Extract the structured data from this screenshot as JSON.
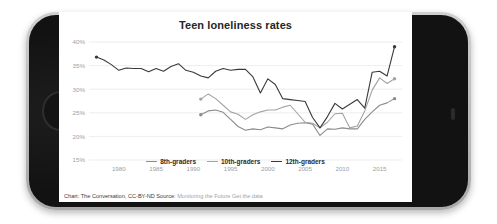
{
  "device": {
    "type": "smartphone-landscape",
    "home_button": "home-button",
    "frame_color": "#c2c2c2",
    "bezel_color": "#121212"
  },
  "chart_data": {
    "type": "line",
    "title": "Teen loneliness rates",
    "xlabel": "",
    "ylabel": "",
    "xlim": [
      1976,
      2018
    ],
    "ylim": [
      15,
      40
    ],
    "grid": true,
    "y_ticks": [
      "15%",
      "20%",
      "25%",
      "30%",
      "35%",
      "40%"
    ],
    "y_tick_values": [
      15,
      20,
      25,
      30,
      35,
      40
    ],
    "x_ticks": [
      "1980",
      "1985",
      "1990",
      "1995",
      "2000",
      "2005",
      "2010",
      "2015"
    ],
    "x_tick_values": [
      1980,
      1985,
      1990,
      1995,
      2000,
      2005,
      2010,
      2015
    ],
    "legend_position": "bottom-center",
    "series": [
      {
        "name": "8th-graders",
        "color": "#8c8c8c",
        "x": [
          1991,
          1992,
          1993,
          1994,
          1995,
          1996,
          1997,
          1998,
          1999,
          2000,
          2001,
          2002,
          2003,
          2004,
          2005,
          2006,
          2007,
          2008,
          2009,
          2010,
          2011,
          2012,
          2013,
          2014,
          2015,
          2016,
          2017
        ],
        "values": [
          24.6,
          25.4,
          25.6,
          25.1,
          23.6,
          22.1,
          21.3,
          21.6,
          21.4,
          22.0,
          21.8,
          21.6,
          22.4,
          22.8,
          22.9,
          22.6,
          20.2,
          21.6,
          21.5,
          21.8,
          21.6,
          21.6,
          23.6,
          25.2,
          26.6,
          27.1,
          28.0
        ],
        "markers": {
          "first": true,
          "last": true
        }
      },
      {
        "name": "10th-graders",
        "color": "#a3a3a3",
        "x": [
          1991,
          1992,
          1993,
          1994,
          1995,
          1996,
          1997,
          1998,
          1999,
          2000,
          2001,
          2002,
          2003,
          2004,
          2005,
          2006,
          2007,
          2008,
          2009,
          2010,
          2011,
          2012,
          2013,
          2014,
          2015,
          2016,
          2017
        ],
        "values": [
          27.9,
          29.0,
          28.0,
          26.6,
          25.2,
          24.7,
          23.6,
          24.6,
          25.2,
          25.6,
          25.6,
          26.2,
          26.6,
          24.8,
          23.0,
          22.8,
          21.8,
          23.0,
          24.8,
          24.9,
          21.8,
          22.2,
          25.4,
          29.8,
          32.4,
          31.2,
          32.2
        ],
        "markers": {
          "first": true,
          "last": true
        }
      },
      {
        "name": "12th-graders",
        "color": "#3a3a3a",
        "x": [
          1977,
          1978,
          1979,
          1980,
          1981,
          1982,
          1983,
          1984,
          1985,
          1986,
          1987,
          1988,
          1989,
          1990,
          1991,
          1992,
          1993,
          1994,
          1995,
          1996,
          1997,
          1998,
          1999,
          2000,
          2001,
          2002,
          2003,
          2004,
          2005,
          2006,
          2007,
          2008,
          2009,
          2010,
          2011,
          2012,
          2013,
          2014,
          2015,
          2016,
          2017
        ],
        "values": [
          36.8,
          36.2,
          35.2,
          34.0,
          34.5,
          34.4,
          34.4,
          33.7,
          34.4,
          33.8,
          34.8,
          35.4,
          34.0,
          33.6,
          32.8,
          32.4,
          33.8,
          34.4,
          34.0,
          34.2,
          34.2,
          32.6,
          29.2,
          32.2,
          31.0,
          28.0,
          27.8,
          27.6,
          27.4,
          24.0,
          21.8,
          24.2,
          27.0,
          25.8,
          26.8,
          27.8,
          26.0,
          33.6,
          33.8,
          32.8,
          39.0
        ],
        "markers": {
          "first": true,
          "last": true
        }
      }
    ]
  },
  "legend": {
    "items": [
      {
        "label": "8th-graders",
        "color": "#8c8c8c"
      },
      {
        "label": "10th-graders",
        "color": "#a3a3a3"
      },
      {
        "label": "12th-graders",
        "color": "#3a3a3a"
      }
    ]
  },
  "footer": {
    "credit": "Chart: The Conversation, CC-BY-ND",
    "source_label": "Source:",
    "source_name": "Monitoring the Future",
    "get_data_link": "Get the data"
  }
}
